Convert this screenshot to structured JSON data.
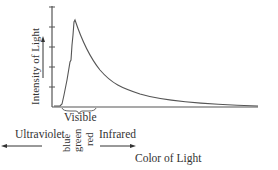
{
  "diagram": {
    "y_axis_label": "Intensity of Light",
    "x_axis_label": "Color of Light",
    "brace_label": "Visible",
    "left_arrow_label": "Ultraviolet",
    "right_arrow_label": "Infrared",
    "color_labels": [
      "blue",
      "green",
      "red"
    ],
    "curve_description": "Spectrum intensity peaks sharply in the blue region then decays gradually toward infrared",
    "stroke_color": "#555555"
  }
}
